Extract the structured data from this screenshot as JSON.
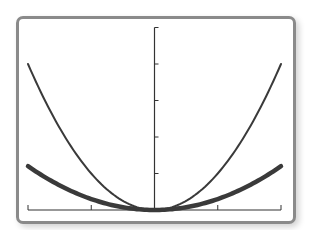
{
  "chart_data": {
    "type": "line",
    "title": "",
    "xlabel": "",
    "ylabel": "",
    "xlim": [
      -2,
      2
    ],
    "ylim": [
      0,
      5
    ],
    "x_ticks": [
      -2,
      -1,
      0,
      1,
      2
    ],
    "y_ticks": [
      0,
      1,
      2,
      3,
      4,
      5
    ],
    "grid": false,
    "legend": null,
    "series": [
      {
        "name": "y = x^2",
        "coefficient": 1.0,
        "style": "thin",
        "color": "#3a3a3a",
        "x": [
          -2,
          -1.5,
          -1,
          -0.5,
          0,
          0.5,
          1,
          1.5,
          2
        ],
        "values": [
          4,
          2.25,
          1,
          0.25,
          0,
          0.25,
          1,
          2.25,
          4
        ]
      },
      {
        "name": "y = 0.3x^2",
        "coefficient": 0.3,
        "style": "thick",
        "color": "#3a3a3a",
        "x": [
          -2,
          -1.5,
          -1,
          -0.5,
          0,
          0.5,
          1,
          1.5,
          2
        ],
        "values": [
          1.2,
          0.675,
          0.3,
          0.075,
          0,
          0.075,
          0.3,
          0.675,
          1.2
        ]
      }
    ]
  },
  "colors": {
    "frame": "#8a8a8a",
    "axis": "#333333",
    "curve": "#3a3a3a"
  }
}
